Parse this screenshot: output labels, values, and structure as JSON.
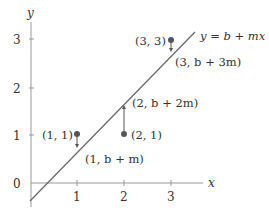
{
  "diagram": {
    "type": "linear-regression-residuals",
    "axes": {
      "x_label": "x",
      "y_label": "y",
      "x_ticks": [
        "1",
        "2",
        "3"
      ],
      "y_ticks": [
        "0",
        "1",
        "2",
        "3"
      ],
      "axis_color": "#888888"
    },
    "line": {
      "label": "y = b + mx",
      "color": "#555555"
    },
    "points": [
      {
        "label": "(1, 1)",
        "x": 1,
        "y": 1
      },
      {
        "label": "(2, 1)",
        "x": 2,
        "y": 1
      },
      {
        "label": "(3, 3)",
        "x": 3,
        "y": 3
      }
    ],
    "fitted_points": [
      {
        "label": "(1, b + m)",
        "x": 1
      },
      {
        "label": "(2, b + 2m)",
        "x": 2
      },
      {
        "label": "(3, b + 3m)",
        "x": 3
      }
    ],
    "point_color": "#555555"
  }
}
